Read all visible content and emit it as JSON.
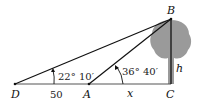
{
  "diagram": {
    "points": {
      "D": {
        "label": "D",
        "x": 15,
        "y": 84
      },
      "A": {
        "label": "A",
        "x": 89,
        "y": 84
      },
      "C": {
        "label": "C",
        "x": 171,
        "y": 84
      },
      "B": {
        "label": "B",
        "x": 171,
        "y": 19
      }
    },
    "labels": {
      "D": "D",
      "A": "A",
      "C": "C",
      "B": "B",
      "h": "h",
      "x": "x",
      "distance_DA": "50",
      "angle_D": "22° 10′",
      "angle_A": "36° 40′"
    },
    "colors": {
      "line": "#111111",
      "ground": "#666666",
      "tree": "#9a9a9a"
    }
  }
}
